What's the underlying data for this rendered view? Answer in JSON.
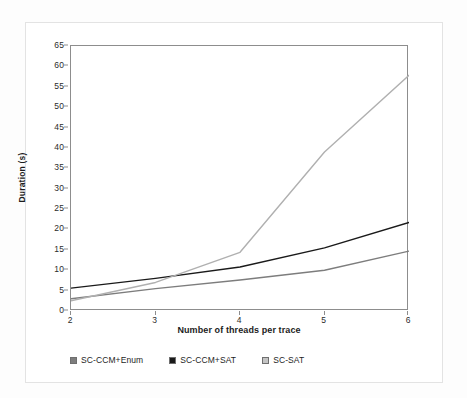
{
  "chart_data": {
    "type": "line",
    "title": "",
    "xlabel": "Number of threads per trace",
    "ylabel": "Duration (s)",
    "x": [
      2,
      3,
      4,
      5,
      6
    ],
    "xtick_labels": [
      "2",
      "3",
      "4",
      "5",
      "6"
    ],
    "ytick_labels": [
      "0",
      "5",
      "10",
      "15",
      "20",
      "25",
      "30",
      "35",
      "40",
      "45",
      "50",
      "55",
      "60",
      "65"
    ],
    "ytick_values": [
      0,
      5,
      10,
      15,
      20,
      25,
      30,
      35,
      40,
      45,
      50,
      55,
      60,
      65
    ],
    "xlim": [
      2,
      6
    ],
    "ylim": [
      0,
      65
    ],
    "grid": false,
    "legend_position": "bottom-left",
    "series": [
      {
        "name": "SC-CCM+Enum",
        "color": "#7d7d7d",
        "values": [
          3.0,
          5.5,
          7.6,
          10.0,
          14.7
        ]
      },
      {
        "name": "SC-CCM+SAT",
        "color": "#1a1a1a",
        "values": [
          5.6,
          8.0,
          10.8,
          15.5,
          21.7
        ]
      },
      {
        "name": "SC-SAT",
        "color": "#b0b0b0",
        "values": [
          2.5,
          7.0,
          14.4,
          39.0,
          57.8
        ]
      }
    ]
  },
  "axes": {
    "y_title": "Duration (s)",
    "x_title": "Number of threads per trace",
    "y_labels": [
      "65",
      "60",
      "55",
      "50",
      "45",
      "40",
      "35",
      "30",
      "25",
      "20",
      "15",
      "10",
      "5",
      "0"
    ],
    "x_labels": [
      "2",
      "3",
      "4",
      "5",
      "6"
    ]
  },
  "legend": {
    "items": [
      {
        "label": "SC-CCM+Enum",
        "color": "#7d7d7d"
      },
      {
        "label": "SC-CCM+SAT",
        "color": "#1a1a1a"
      },
      {
        "label": "SC-SAT",
        "color": "#c4c4c4"
      }
    ]
  },
  "colors": {
    "plot_border": "#8d8d8d",
    "outer_frame": "#e3e3e3",
    "background": "#ffffff",
    "text": "#1c1c1c"
  }
}
